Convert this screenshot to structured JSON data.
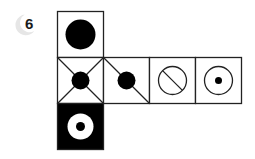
{
  "problem": {
    "number": "6",
    "badge_color": "#e6e6e6"
  },
  "net": {
    "cell_size": 46,
    "stroke_color": "#222222",
    "cells": [
      {
        "id": "top",
        "row": 0,
        "col": 0,
        "symbol": "filled-circle",
        "background": "white"
      },
      {
        "id": "middle-1",
        "row": 1,
        "col": 0,
        "symbol": "filled-circle-with-x-diagonals",
        "background": "white"
      },
      {
        "id": "middle-2",
        "row": 1,
        "col": 1,
        "symbol": "filled-circle-with-single-diagonal",
        "background": "white"
      },
      {
        "id": "middle-3",
        "row": 1,
        "col": 2,
        "symbol": "circle-with-slash",
        "background": "white"
      },
      {
        "id": "middle-4",
        "row": 1,
        "col": 3,
        "symbol": "circle-with-center-dot",
        "background": "white"
      },
      {
        "id": "bottom",
        "row": 2,
        "col": 0,
        "symbol": "white-ring-with-black-dot",
        "background": "black"
      }
    ]
  }
}
